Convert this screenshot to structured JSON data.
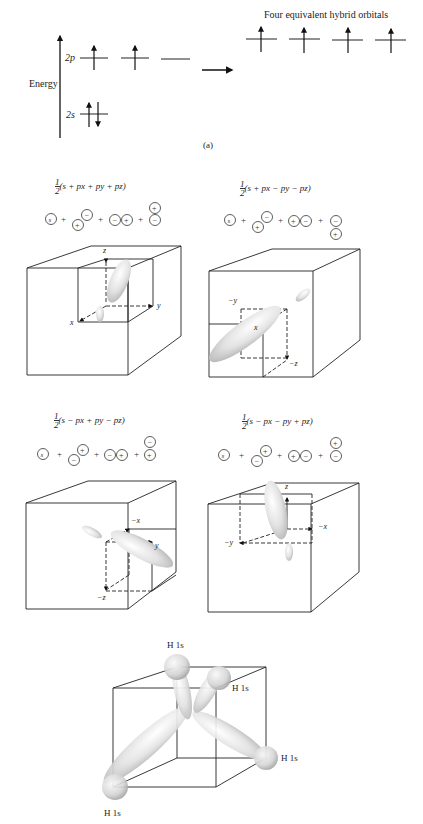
{
  "panel_a": {
    "axis_label": "Energy",
    "level_2p": "2p",
    "level_2s": "2s",
    "hybrid_title": "Four equivalent hybrid orbitals",
    "caption": "(a)"
  },
  "hybrids": [
    {
      "formula_prefix": "1",
      "formula_den": "2",
      "formula": "(s + px + py + pz)",
      "combination": [
        "s",
        "+",
        "px(+/−)",
        "+",
        "py(−+)",
        "+",
        "pz(+/−)"
      ],
      "axes": {
        "a": "z",
        "b": "y",
        "c": "x"
      }
    },
    {
      "formula_prefix": "1",
      "formula_den": "2",
      "formula": "(s + px − py − pz)",
      "combination": [
        "s",
        "+",
        "px(+/−)",
        "+",
        "py(+−)",
        "+",
        "pz(−/+)"
      ],
      "axes": {
        "a": "−y",
        "b": "x",
        "c": "−z"
      }
    },
    {
      "formula_prefix": "1",
      "formula_den": "2",
      "formula": "(s − px + py − pz)",
      "combination": [
        "s",
        "+",
        "px(−/+)",
        "+",
        "py(−+)",
        "+",
        "pz(−/+)"
      ],
      "axes": {
        "a": "−x",
        "b": "y",
        "c": "−z"
      }
    },
    {
      "formula_prefix": "1",
      "formula_den": "2",
      "formula": "(s − px − py + pz)",
      "combination": [
        "s",
        "+",
        "px(−/+)",
        "+",
        "py(+−)",
        "+",
        "pz(+/−)"
      ],
      "axes": {
        "a": "z",
        "b": "−x",
        "c": "−y"
      }
    }
  ],
  "methane": {
    "h_labels": [
      "H 1s",
      "H 1s",
      "H 1s",
      "H 1s"
    ]
  }
}
